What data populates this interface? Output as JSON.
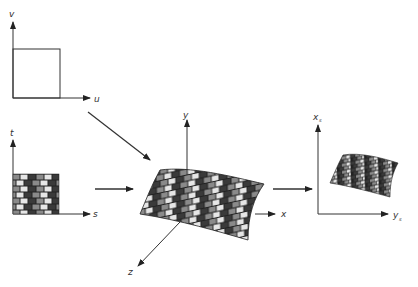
{
  "figure": {
    "panels": {
      "parameter_space": {
        "axis_h": "u",
        "axis_v": "v"
      },
      "texture_space": {
        "axis_h": "s",
        "axis_v": "t"
      },
      "object_space": {
        "axis_x": "x",
        "axis_y": "y",
        "axis_z": "z"
      },
      "screen_space": {
        "axis_h": "y",
        "axis_h_sub": "s",
        "axis_v": "x",
        "axis_v_sub": "s"
      }
    },
    "colors": {
      "line": "#333333",
      "brick_dark": "#3a3a3a",
      "brick_mid": "#8a8a8a",
      "brick_light": "#e6e6e6",
      "mortar": "#222222"
    }
  }
}
